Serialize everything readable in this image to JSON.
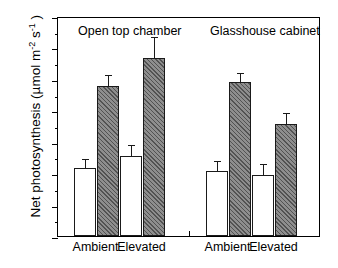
{
  "chart_data": {
    "type": "bar",
    "title": "",
    "xlabel": "",
    "ylabel": "Net photosynthesis (µmol m⁻² s⁻¹)",
    "ylabel_parts": {
      "text_before": "Net photosynthesis (µmol m",
      "sup1": "-2",
      "mid": " s",
      "sup2": "-1",
      "text_after": " )"
    },
    "ylim": [
      0,
      35
    ],
    "yticks": [
      0,
      5,
      10,
      15,
      20,
      25,
      30,
      35
    ],
    "ytick_labels": [
      "0",
      "5",
      "10",
      "15",
      "20",
      "25",
      "30",
      "35"
    ],
    "minor_tick_step": 2.5,
    "grid": false,
    "legend": "none",
    "panels": [
      {
        "title": "Open top chamber",
        "categories": [
          "Ambient",
          "Elevated"
        ],
        "series": [
          {
            "name": "open",
            "values": [
              10.8,
              12.7
            ],
            "errors": [
              1.3,
              1.6
            ]
          },
          {
            "name": "hatched",
            "values": [
              23.9,
              28.4
            ],
            "errors": [
              1.6,
              3.1
            ]
          }
        ]
      },
      {
        "title": "Glasshouse cabinet",
        "categories": [
          "Ambient",
          "Elevated"
        ],
        "series": [
          {
            "name": "open",
            "values": [
              10.4,
              9.7
            ],
            "errors": [
              1.3,
              1.6
            ]
          },
          {
            "name": "hatched",
            "values": [
              24.5,
              17.9
            ],
            "errors": [
              1.3,
              1.5
            ]
          }
        ]
      }
    ]
  }
}
